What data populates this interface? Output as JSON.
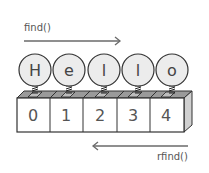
{
  "forward_label": "find()",
  "reverse_label": "rfind()",
  "characters": [
    "H",
    "e",
    "l",
    "l",
    "o"
  ],
  "indices": [
    "0",
    "1",
    "2",
    "3",
    "4"
  ],
  "colors": {
    "circle_fill": "#ececec",
    "stroke": "#333333",
    "box_top": "#9a9a9a",
    "box_side": "#d0d0d0",
    "arrow": "#666666",
    "text": "#555555"
  }
}
